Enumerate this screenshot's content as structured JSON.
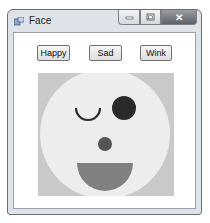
{
  "window": {
    "title": "Face",
    "controls": {
      "minimize": "minimize",
      "maximize": "maximize",
      "close": "✕"
    }
  },
  "buttons": [
    {
      "label": "Happy"
    },
    {
      "label": "Sad"
    },
    {
      "label": "Wink"
    }
  ],
  "canvas": {
    "background": "#c9c9c9",
    "face_color": "#ededed",
    "eye_color": "#2a2a2a",
    "nose_color": "#555555",
    "mouth_color": "#808080",
    "state": "Wink"
  }
}
